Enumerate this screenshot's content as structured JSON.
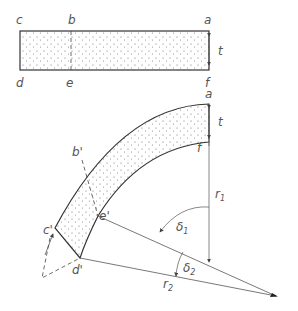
{
  "figure": {
    "colors": {
      "stroke": "#333333",
      "thin": "#555555",
      "stipple": "#666666",
      "label": "#555555"
    },
    "straight_bar": {
      "labels": {
        "c": "c",
        "b": "b",
        "a": "a",
        "d": "d",
        "e": "e",
        "f": "f",
        "t": "t"
      }
    },
    "bent_bar": {
      "labels": {
        "a": "a",
        "t": "t",
        "b_prime": "b'",
        "f": "f",
        "c_prime": "c'",
        "e_prime": "e'",
        "d_prime": "d'"
      }
    },
    "geometry_labels": {
      "r1": "r",
      "r1_sub": "1",
      "r2": "r",
      "r2_sub": "2",
      "delta1": "δ",
      "delta1_sub": "1",
      "delta2": "δ",
      "delta2_sub": "2"
    }
  }
}
